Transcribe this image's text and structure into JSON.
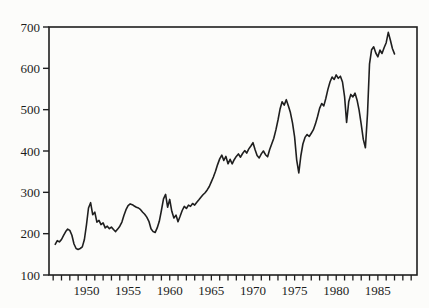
{
  "figure": {
    "background": "#fcfcfa"
  },
  "chart_data": {
    "type": "line",
    "title": "",
    "xlabel": "",
    "ylabel": "",
    "legend": "none",
    "grid": false,
    "line_color": "#1f1f1f",
    "axis_color": "#1f1f1f",
    "text_color": "#1c1c1c",
    "xlim": [
      1945.5,
      1989.7
    ],
    "ylim": [
      100,
      700
    ],
    "yticks": [
      100,
      200,
      300,
      400,
      500,
      600,
      700
    ],
    "ytick_labels": [
      "100",
      "200",
      "300",
      "400",
      "500",
      "600",
      "700"
    ],
    "xtick_years": [
      1950,
      1955,
      1960,
      1965,
      1970,
      1975,
      1980,
      1985
    ],
    "xtick_labels": [
      "1950",
      "1955",
      "1960",
      "1965",
      "1970",
      "1975",
      "1980",
      "1985"
    ],
    "minor_xtick_start": 1946,
    "minor_xtick_end": 1989,
    "x_start": 1946.25,
    "x_step": 0.25,
    "values": [
      174,
      183,
      180,
      186,
      196,
      205,
      211,
      208,
      196,
      175,
      164,
      162,
      164,
      168,
      186,
      222,
      262,
      275,
      246,
      252,
      228,
      232,
      222,
      226,
      214,
      218,
      212,
      216,
      210,
      205,
      211,
      218,
      228,
      244,
      258,
      268,
      272,
      270,
      267,
      264,
      262,
      258,
      252,
      247,
      240,
      230,
      212,
      205,
      203,
      214,
      230,
      256,
      284,
      295,
      264,
      283,
      254,
      238,
      245,
      229,
      242,
      256,
      266,
      261,
      269,
      266,
      273,
      269,
      276,
      282,
      288,
      294,
      299,
      306,
      314,
      326,
      337,
      351,
      367,
      381,
      390,
      377,
      387,
      369,
      380,
      369,
      379,
      387,
      393,
      385,
      394,
      401,
      395,
      405,
      412,
      420,
      403,
      389,
      383,
      393,
      400,
      391,
      386,
      403,
      417,
      431,
      451,
      475,
      501,
      519,
      511,
      524,
      509,
      493,
      468,
      434,
      378,
      347,
      389,
      417,
      433,
      440,
      435,
      443,
      451,
      465,
      483,
      503,
      515,
      509,
      527,
      549,
      567,
      579,
      573,
      584,
      576,
      581,
      567,
      531,
      469,
      519,
      537,
      531,
      540,
      523,
      499,
      465,
      428,
      408,
      490,
      610,
      645,
      652,
      637,
      628,
      644,
      636,
      650,
      662,
      687,
      668,
      648,
      635
    ]
  }
}
